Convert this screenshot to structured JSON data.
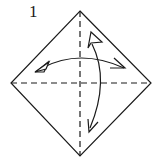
{
  "diagram": {
    "step_number": "1",
    "elements": [
      {
        "type": "square-paper",
        "orientation": "diamond"
      },
      {
        "type": "valley-fold-line",
        "direction": "vertical diagonal",
        "style": "dashed"
      },
      {
        "type": "valley-fold-line",
        "direction": "horizontal diagonal",
        "style": "dashed"
      },
      {
        "type": "fold-and-unfold-arrow",
        "direction": "left-right"
      },
      {
        "type": "fold-and-unfold-arrow",
        "direction": "top-bottom"
      }
    ],
    "colors": {
      "line": "#1a1a1a",
      "background": "#ffffff"
    }
  }
}
